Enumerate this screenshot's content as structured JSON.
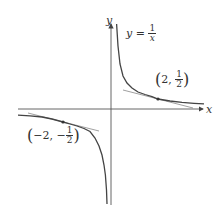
{
  "diagram": {
    "axes": {
      "x_label": "x",
      "y_label": "y"
    },
    "curve_label": {
      "lhs": "y",
      "eq": "=",
      "num": "1",
      "den": "x"
    },
    "points": [
      {
        "label_x": "2",
        "label_sep": ",",
        "label_num": "1",
        "label_den": "2",
        "sign": "",
        "x": 2,
        "y": 0.5
      },
      {
        "label_x": "−2",
        "label_sep": ",",
        "label_num": "1",
        "label_den": "2",
        "sign": "−",
        "x": -2,
        "y": -0.5
      }
    ],
    "colors": {
      "curve": "#444444",
      "axis": "#555555",
      "tangent": "#888888",
      "text": "#333333"
    }
  }
}
